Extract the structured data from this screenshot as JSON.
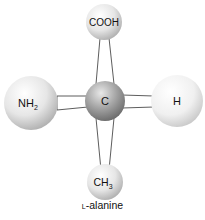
{
  "diagram": {
    "title": "L-alanine",
    "caption": {
      "prefix_small_caps": "L",
      "text": "-alanine"
    },
    "central_atom": {
      "label": "C",
      "color": "#8a8a8a"
    },
    "substituents": [
      {
        "position": "top",
        "label": "COOH",
        "subscript": ""
      },
      {
        "position": "left",
        "label": "NH",
        "subscript": "2"
      },
      {
        "position": "right",
        "label": "H",
        "subscript": ""
      },
      {
        "position": "bottom",
        "label": "CH",
        "subscript": "3"
      }
    ],
    "bond_style": "wedge-outline"
  }
}
